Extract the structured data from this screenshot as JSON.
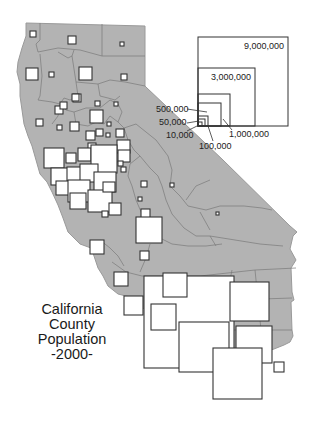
{
  "title": {
    "line1": "California",
    "line2": "County",
    "line3": "Population",
    "line4": "-2000-"
  },
  "legend": {
    "type": "proportional-squares",
    "entries": [
      {
        "value": 9000000,
        "label": "9,000,000"
      },
      {
        "value": 3000000,
        "label": "3,000,000"
      },
      {
        "value": 1000000,
        "label": "1,000,000"
      },
      {
        "value": 500000,
        "label": "500,000"
      },
      {
        "value": 100000,
        "label": "100,000"
      },
      {
        "value": 50000,
        "label": "50,000"
      },
      {
        "value": 10000,
        "label": "10,000"
      }
    ]
  },
  "colors": {
    "land": "#b3b3b3",
    "county_border": "#7a7a7a",
    "symbol_fill": "#ffffff",
    "symbol_stroke": "#333333",
    "text": "#1a1a1a"
  }
}
